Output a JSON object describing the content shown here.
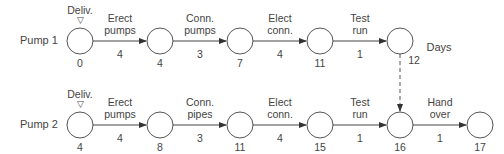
{
  "rows": [
    {
      "label": "Pump 1",
      "start_label": "Deliv.",
      "start_marker": "▽",
      "activities": [
        {
          "name_l1": "Erect",
          "name_l2": "pumps",
          "duration": "4"
        },
        {
          "name_l1": "Conn.",
          "name_l2": "pumps",
          "duration": "3"
        },
        {
          "name_l1": "Elect",
          "name_l2": "conn.",
          "duration": "4"
        },
        {
          "name_l1": "Test",
          "name_l2": "run",
          "duration": "1"
        }
      ],
      "node_times": [
        "0",
        "4",
        "7",
        "11",
        "12"
      ]
    },
    {
      "label": "Pump 2",
      "start_label": "Deliv.",
      "start_marker": "▽",
      "activities": [
        {
          "name_l1": "Erect",
          "name_l2": "pumps",
          "duration": "4"
        },
        {
          "name_l1": "Conn.",
          "name_l2": "pipes",
          "duration": "3"
        },
        {
          "name_l1": "Elect",
          "name_l2": "conn.",
          "duration": "4"
        },
        {
          "name_l1": "Test",
          "name_l2": "run",
          "duration": "1"
        },
        {
          "name_l1": "Hand",
          "name_l2": "over",
          "duration": "1"
        }
      ],
      "node_times": [
        "4",
        "8",
        "11",
        "15",
        "16",
        "17"
      ]
    }
  ],
  "units_label": "Days",
  "dummy_link": {
    "from": "Pump 1 node 12",
    "to": "Pump 2 node 16",
    "style": "dashed"
  }
}
